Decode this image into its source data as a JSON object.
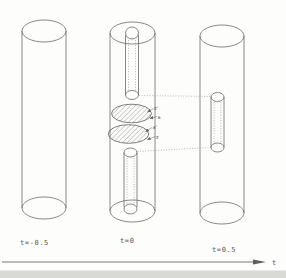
{
  "figure": {
    "description_labels": {
      "axis_label": "t"
    },
    "snapshots": [
      {
        "label": "t=-0.5"
      },
      {
        "label": "t=0"
      },
      {
        "label": "t=0.5"
      }
    ],
    "disk_labels": {
      "upper_disk_top": "z'",
      "upper_disk_bottom": "a",
      "lower_disk_top": "a'",
      "lower_disk_bottom": "z"
    },
    "colors": {
      "ink": "#6b6b6b",
      "hatch": "#5f5f5f",
      "background": "#fdfdfc",
      "bottom_strip": "#d9d9d6"
    }
  }
}
